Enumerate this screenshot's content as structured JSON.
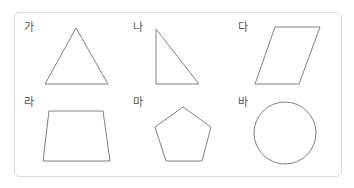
{
  "figures": [
    {
      "label": "가",
      "shape": "triangle (acute/isosceles)"
    },
    {
      "label": "나",
      "shape": "right triangle"
    },
    {
      "label": "다",
      "shape": "parallelogram"
    },
    {
      "label": "라",
      "shape": "trapezoid"
    },
    {
      "label": "마",
      "shape": "pentagon"
    },
    {
      "label": "바",
      "shape": "circle"
    }
  ],
  "colors": {
    "stroke": "#808080",
    "border": "#d9d9d9",
    "label": "#555555"
  }
}
